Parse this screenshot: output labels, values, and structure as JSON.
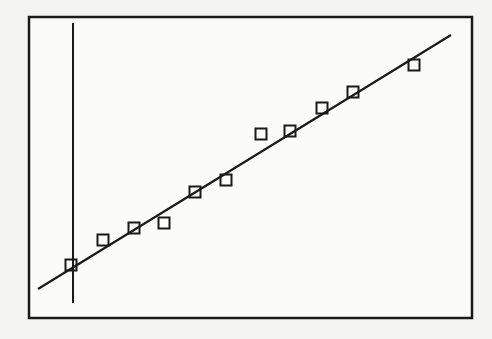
{
  "chart_data": {
    "type": "scatter",
    "title": "",
    "xlabel": "",
    "ylabel": "",
    "grid": false,
    "legend": null,
    "marker": "open-square",
    "points_px": [
      {
        "x": 71,
        "y": 265
      },
      {
        "x": 103,
        "y": 240
      },
      {
        "x": 134,
        "y": 228
      },
      {
        "x": 164,
        "y": 223
      },
      {
        "x": 195,
        "y": 192
      },
      {
        "x": 226,
        "y": 180
      },
      {
        "x": 261,
        "y": 134
      },
      {
        "x": 290,
        "y": 131
      },
      {
        "x": 322,
        "y": 108
      },
      {
        "x": 353,
        "y": 92
      },
      {
        "x": 414,
        "y": 65
      }
    ],
    "x": [
      1,
      2,
      3,
      4,
      5,
      6,
      7,
      8,
      9,
      10,
      12
    ],
    "y": [
      1.0,
      2.0,
      2.5,
      2.7,
      3.9,
      4.4,
      6.2,
      6.3,
      7.2,
      7.9,
      9.0
    ],
    "fit_line": {
      "type": "linear",
      "x1": 38,
      "y1": 289,
      "x2": 451,
      "y2": 35
    },
    "frame": {
      "left": 29,
      "top": 17,
      "right": 472,
      "bottom": 318
    },
    "y_axis_line": {
      "x": 73,
      "y1": 23,
      "y2": 303
    }
  },
  "colors": {
    "ink": "#1a1a1a",
    "paper": "#f4f4f2",
    "plot_bg": "#fbfbfa"
  }
}
